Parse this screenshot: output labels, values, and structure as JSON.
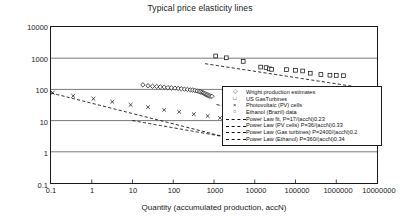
{
  "chart_data": {
    "type": "scatter",
    "title": "Typical price elasticity lines",
    "xlabel": "Quantity (accumulated production, accN)",
    "ylabel": "Specific Price ($/unit)",
    "xscale": "log",
    "yscale": "log",
    "xlim": [
      0.1,
      10000000
    ],
    "ylim": [
      0.1,
      10000
    ],
    "grid": "horizontal",
    "xticks": [
      "0.1",
      "1",
      "10",
      "100",
      "1000",
      "10000",
      "100000",
      "1000000",
      "10000000"
    ],
    "yticks": [
      "0.1",
      "1",
      "10",
      "100",
      "1000",
      "10000"
    ],
    "legend_position": "center-right",
    "series": [
      {
        "name": "Wright production estimates",
        "marker": "open-diamond",
        "points": [
          [
            18,
            140
          ],
          [
            24,
            131
          ],
          [
            31,
            126
          ],
          [
            39,
            124
          ],
          [
            48,
            120
          ],
          [
            60,
            118
          ],
          [
            74,
            114
          ],
          [
            90,
            112
          ],
          [
            110,
            110
          ],
          [
            132,
            107
          ],
          [
            158,
            105
          ],
          [
            188,
            102
          ],
          [
            222,
            100
          ],
          [
            262,
            97
          ],
          [
            300,
            95
          ],
          [
            340,
            92
          ],
          [
            385,
            89
          ],
          [
            430,
            86
          ],
          [
            470,
            83
          ],
          [
            510,
            80
          ],
          [
            545,
            77
          ],
          [
            580,
            74
          ],
          [
            615,
            71
          ],
          [
            650,
            68
          ],
          [
            690,
            66
          ],
          [
            730,
            64
          ],
          [
            780,
            62
          ],
          [
            830,
            61
          ],
          [
            890,
            60
          ]
        ]
      },
      {
        "name": "US GasTurbines",
        "marker": "open-square",
        "points": [
          [
            1100,
            1180
          ],
          [
            2000,
            1030
          ],
          [
            5200,
            790
          ],
          [
            14000,
            520
          ],
          [
            19000,
            500
          ],
          [
            23000,
            455
          ],
          [
            26000,
            440
          ],
          [
            60000,
            430
          ],
          [
            100000,
            410
          ],
          [
            150000,
            390
          ],
          [
            230000,
            330
          ],
          [
            420000,
            300
          ],
          [
            700000,
            285
          ],
          [
            1000000,
            280
          ],
          [
            1500000,
            275
          ]
        ]
      },
      {
        "name": "Photovoltaic (PV) cells",
        "marker": "x-cross",
        "points": [
          [
            0.11,
            78
          ],
          [
            0.35,
            62
          ],
          [
            1.1,
            50
          ],
          [
            3.2,
            40
          ],
          [
            9,
            32
          ],
          [
            24,
            27
          ],
          [
            60,
            22
          ],
          [
            140,
            19
          ],
          [
            320,
            16
          ],
          [
            700,
            14
          ],
          [
            1400,
            12.2
          ],
          [
            2600,
            11.0
          ]
        ]
      },
      {
        "name": "Ethanol (Brazil) data",
        "marker": "open-circle",
        "points": [
          [
            2100,
            10.0
          ],
          [
            2600,
            9.6
          ],
          [
            3200,
            9.2
          ],
          [
            4000,
            8.8
          ],
          [
            5000,
            8.5
          ],
          [
            6300,
            8.2
          ],
          [
            8000,
            7.9
          ],
          [
            10000,
            7.6
          ],
          [
            13000,
            7.3
          ],
          [
            17000,
            7.0
          ],
          [
            22000,
            6.7
          ],
          [
            28000,
            6.4
          ],
          [
            36000,
            6.1
          ],
          [
            46000,
            5.9
          ],
          [
            60000,
            5.6
          ],
          [
            78000,
            5.3
          ],
          [
            100000,
            5.0
          ],
          [
            130000,
            4.8
          ],
          [
            170000,
            4.6
          ],
          [
            220000,
            4.4
          ],
          [
            290000,
            4.2
          ],
          [
            380000,
            4.0
          ],
          [
            500000,
            3.8
          ],
          [
            1200000,
            3.0
          ],
          [
            3000000,
            2.7
          ]
        ]
      }
    ],
    "fit_lines": [
      {
        "name": "Power Law fit, P=17/(accN)0.23",
        "coefficient": 17,
        "exponent": 0.23,
        "applies_to": "Wright production estimates"
      },
      {
        "name": "Power Law (PV cells) P=36/(accN)0.33",
        "coefficient": 36,
        "exponent": 0.33,
        "applies_to": "Photovoltaic (PV) cells"
      },
      {
        "name": "Power Law (Gas turbines) P=2400/(accN)0.2",
        "coefficient": 2400,
        "exponent": 0.2,
        "applies_to": "US GasTurbines"
      },
      {
        "name": "Power Law (Ethanol) P=360/(accN)0.34",
        "coefficient": 360,
        "exponent": 0.34,
        "applies_to": "Ethanol (Brazil) data"
      }
    ]
  },
  "legend": {
    "entries": [
      {
        "label": "Wright production estimates",
        "key": "open-diamond"
      },
      {
        "label": "US GasTurbines",
        "key": "open-square"
      },
      {
        "label": "Photovoltaic (PV) cells",
        "key": "x-cross"
      },
      {
        "label": "Ethanol (Brazil) data",
        "key": "open-circle"
      },
      {
        "label": "Power Law fit, P=17/(accN)0.23",
        "key": "dashed-line"
      },
      {
        "label": "Power Law (PV cells) P=36/(accN)0.33",
        "key": "dashed-line"
      },
      {
        "label": "Power Law (Gas turbines) P=2400/(accN)0.2",
        "key": "dashed-line"
      },
      {
        "label": "Power Law (Ethanol) P=360/(accN)0.34",
        "key": "dashed-line"
      }
    ]
  },
  "colors": {
    "axis": "#1a1a1a",
    "grid": "#555555",
    "marker": "#111111",
    "fitline": "#111111",
    "background": "#ffffff"
  }
}
